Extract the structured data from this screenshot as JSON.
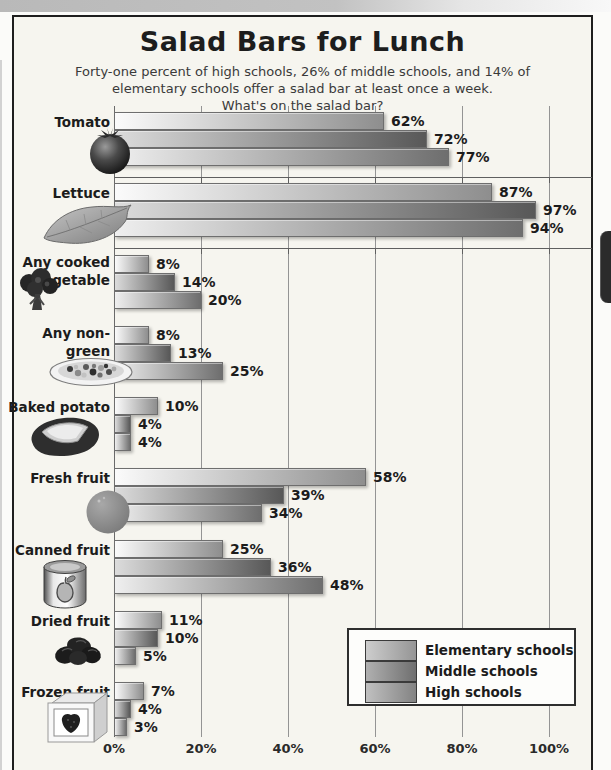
{
  "chart_data": {
    "type": "bar",
    "orientation": "horizontal",
    "title": "Salad Bars for Lunch",
    "subtitle_lines": [
      "Forty-one percent of high schools, 26% of middle schools, and 14% of",
      "elementary schools offer a salad bar at least once a week.",
      "What's on the salad bar?"
    ],
    "xlim": [
      0,
      100
    ],
    "x_tick_labels": [
      "0%",
      "20%",
      "40%",
      "60%",
      "80%",
      "100%"
    ],
    "grid": "vertical",
    "legend_position": "bottom-right",
    "legend_entries": [
      "Elementary schools",
      "Middle schools",
      "High schools"
    ],
    "value_label_suffix": "%",
    "categories": [
      {
        "name": "Tomato",
        "label_lines": [
          "Tomato"
        ],
        "icon": "tomato-icon",
        "values": [
          62,
          72,
          77
        ]
      },
      {
        "name": "Lettuce",
        "label_lines": [
          "Lettuce"
        ],
        "icon": "lettuce-icon",
        "values": [
          87,
          97,
          94
        ]
      },
      {
        "name": "Any cooked vegetable",
        "label_lines": [
          "Any cooked",
          "vegetable"
        ],
        "icon": "broccoli-icon",
        "values": [
          8,
          14,
          20
        ]
      },
      {
        "name": "Any non-green salad",
        "label_lines": [
          "Any non-green",
          "salad"
        ],
        "icon": "salad-plate-icon",
        "values": [
          8,
          13,
          25
        ]
      },
      {
        "name": "Baked potato",
        "label_lines": [
          "Baked potato"
        ],
        "icon": "baked-potato-icon",
        "values": [
          10,
          4,
          4
        ]
      },
      {
        "name": "Fresh fruit",
        "label_lines": [
          "Fresh fruit"
        ],
        "icon": "orange-icon",
        "values": [
          58,
          39,
          34
        ]
      },
      {
        "name": "Canned fruit",
        "label_lines": [
          "Canned fruit"
        ],
        "icon": "fruit-can-icon",
        "values": [
          25,
          36,
          48
        ]
      },
      {
        "name": "Dried fruit",
        "label_lines": [
          "Dried fruit"
        ],
        "icon": "dried-fruit-icon",
        "values": [
          11,
          10,
          5
        ]
      },
      {
        "name": "Frozen fruit",
        "label_lines": [
          "Frozen fruit"
        ],
        "icon": "frozen-fruit-box-icon",
        "values": [
          7,
          4,
          3
        ]
      }
    ],
    "series": [
      {
        "name": "Elementary schools",
        "values": [
          62,
          87,
          8,
          8,
          10,
          58,
          25,
          11,
          7
        ]
      },
      {
        "name": "Middle schools",
        "values": [
          72,
          97,
          14,
          13,
          4,
          39,
          36,
          10,
          4
        ]
      },
      {
        "name": "High schools",
        "values": [
          77,
          94,
          20,
          25,
          4,
          34,
          48,
          5,
          3
        ]
      }
    ]
  },
  "colors": {
    "page_bg": "#fbfbf9",
    "panel_bg": "#f6f5ef",
    "frame_border": "#1e1e1e",
    "grid_line": "#949494",
    "text": "#1c1c1c",
    "legend_bg": "#fdfdfb",
    "side_tab": "#2b2b2b",
    "series": [
      {
        "name": "Elementary schools",
        "from": "#fbfbfb",
        "to": "#8e8e8e",
        "legend_from": "#cdcdcd",
        "legend_to": "#959595"
      },
      {
        "name": "Middle schools",
        "from": "#dcdcdc",
        "to": "#585858",
        "legend_from": "#b0b0b0",
        "legend_to": "#6f6f6f"
      },
      {
        "name": "High schools",
        "from": "#efefef",
        "to": "#6e6e6e",
        "legend_from": "#c0c0c0",
        "legend_to": "#838383"
      }
    ]
  }
}
